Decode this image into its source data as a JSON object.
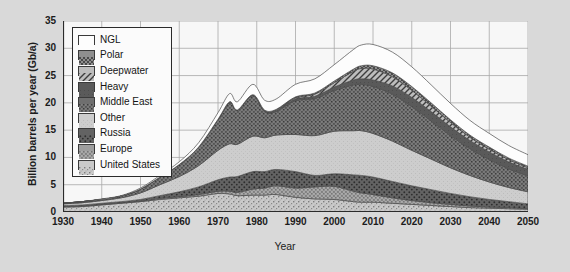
{
  "chart_data": {
    "type": "area",
    "title": "",
    "subtitle": "",
    "xlabel": "Year",
    "ylabel": "Billion barrels per year (Gb/a)",
    "xlim": [
      1930,
      2050
    ],
    "ylim": [
      0,
      35
    ],
    "xticks": [
      1930,
      1940,
      1950,
      1960,
      1970,
      1980,
      1990,
      2000,
      2010,
      2020,
      2030,
      2040,
      2050
    ],
    "yticks": [
      0,
      5,
      10,
      15,
      20,
      25,
      30,
      35
    ],
    "grid": true,
    "stacked": true,
    "legend_position": "top-left",
    "legend_entries": [
      "NGL",
      "Polar",
      "Deepwater",
      "Heavy",
      "Middle East",
      "Other",
      "Russia",
      "Europe",
      "United States"
    ],
    "x": [
      1930,
      1935,
      1940,
      1945,
      1950,
      1955,
      1960,
      1965,
      1970,
      1973,
      1975,
      1979,
      1982,
      1985,
      1990,
      1995,
      2000,
      2005,
      2007,
      2010,
      2015,
      2020,
      2025,
      2030,
      2035,
      2040,
      2045,
      2050
    ],
    "series": [
      {
        "name": "United States",
        "pattern": "light-speckle",
        "color": "#c9c9c9",
        "values": [
          0.9,
          1.0,
          1.3,
          1.6,
          1.9,
          2.3,
          2.6,
          2.9,
          3.4,
          3.3,
          3.0,
          3.1,
          3.1,
          3.2,
          2.7,
          2.4,
          2.3,
          1.9,
          1.8,
          1.8,
          1.6,
          1.4,
          1.2,
          1.0,
          0.8,
          0.7,
          0.6,
          0.5
        ]
      },
      {
        "name": "Europe",
        "pattern": "medium-speckle",
        "color": "#9e9e9e",
        "values": [
          0.1,
          0.1,
          0.1,
          0.1,
          0.1,
          0.2,
          0.2,
          0.3,
          0.4,
          0.5,
          0.6,
          1.1,
          1.3,
          1.6,
          1.7,
          2.2,
          2.4,
          1.9,
          1.7,
          1.4,
          1.0,
          0.7,
          0.5,
          0.4,
          0.3,
          0.2,
          0.2,
          0.1
        ]
      },
      {
        "name": "Russia",
        "pattern": "dark-dot",
        "color": "#636363",
        "values": [
          0.2,
          0.2,
          0.2,
          0.2,
          0.3,
          0.5,
          0.9,
          1.4,
          2.1,
          2.6,
          2.9,
          3.2,
          3.0,
          3.0,
          3.0,
          2.1,
          2.3,
          3.0,
          3.2,
          3.2,
          3.0,
          2.7,
          2.4,
          2.0,
          1.7,
          1.4,
          1.1,
          0.9
        ]
      },
      {
        "name": "Other",
        "pattern": "light-gray",
        "color": "#cdcdcd",
        "values": [
          0.3,
          0.4,
          0.5,
          0.7,
          1.2,
          2.0,
          2.8,
          3.9,
          5.4,
          6.1,
          5.9,
          6.5,
          6.2,
          6.3,
          6.8,
          7.3,
          7.8,
          8.1,
          8.2,
          8.0,
          7.4,
          6.5,
          5.6,
          4.7,
          3.9,
          3.2,
          2.6,
          2.2
        ]
      },
      {
        "name": "Middle East",
        "pattern": "dark-speckle",
        "color": "#6f6f6f",
        "values": [
          0.1,
          0.2,
          0.2,
          0.3,
          0.7,
          1.4,
          2.2,
          3.4,
          5.6,
          7.6,
          6.2,
          7.4,
          4.8,
          4.3,
          6.2,
          6.8,
          7.5,
          8.4,
          8.5,
          8.6,
          8.6,
          8.0,
          7.0,
          5.9,
          4.9,
          4.1,
          3.4,
          2.9
        ]
      },
      {
        "name": "Heavy",
        "pattern": "dark-solid",
        "color": "#5a5a5a",
        "values": [
          0.0,
          0.0,
          0.0,
          0.0,
          0.0,
          0.0,
          0.0,
          0.0,
          0.1,
          0.1,
          0.1,
          0.2,
          0.2,
          0.2,
          0.3,
          0.4,
          0.6,
          0.9,
          1.0,
          1.2,
          1.5,
          1.7,
          1.7,
          1.6,
          1.5,
          1.4,
          1.3,
          1.2
        ]
      },
      {
        "name": "Deepwater",
        "pattern": "diagonal-hatch",
        "color": "#bdbdbd",
        "values": [
          0.0,
          0.0,
          0.0,
          0.0,
          0.0,
          0.0,
          0.0,
          0.0,
          0.0,
          0.0,
          0.0,
          0.0,
          0.0,
          0.1,
          0.2,
          0.4,
          0.8,
          1.6,
          1.9,
          2.0,
          1.7,
          1.3,
          1.0,
          0.8,
          0.6,
          0.5,
          0.4,
          0.3
        ]
      },
      {
        "name": "Polar",
        "pattern": "checker",
        "color": "#8f8f8f",
        "values": [
          0.0,
          0.0,
          0.0,
          0.0,
          0.0,
          0.0,
          0.0,
          0.0,
          0.0,
          0.0,
          0.0,
          0.0,
          0.1,
          0.1,
          0.2,
          0.2,
          0.3,
          0.4,
          0.5,
          0.6,
          0.7,
          0.7,
          0.6,
          0.5,
          0.4,
          0.4,
          0.3,
          0.3
        ]
      },
      {
        "name": "NGL",
        "pattern": "white",
        "color": "#fdfdfd",
        "values": [
          0.0,
          0.0,
          0.1,
          0.1,
          0.2,
          0.3,
          0.5,
          0.8,
          1.2,
          1.5,
          1.5,
          1.9,
          1.8,
          1.9,
          2.3,
          2.6,
          3.0,
          3.6,
          3.8,
          3.9,
          3.8,
          3.6,
          3.3,
          3.0,
          2.7,
          2.5,
          2.3,
          2.1
        ]
      }
    ],
    "totals": [
      1.6,
      1.9,
      2.4,
      3.0,
      4.4,
      6.7,
      9.2,
      12.7,
      18.2,
      21.7,
      20.2,
      23.4,
      20.5,
      20.7,
      23.4,
      24.4,
      27.0,
      29.8,
      30.6,
      30.7,
      29.3,
      26.6,
      23.3,
      19.9,
      16.8,
      14.4,
      12.2,
      10.5
    ]
  },
  "colors": {
    "background": "#d9d9d9",
    "plot_background": "#f7f7f7",
    "grid": "#a8a8a8",
    "axis": "#2b2b2b",
    "text": "#1c1c1c"
  }
}
